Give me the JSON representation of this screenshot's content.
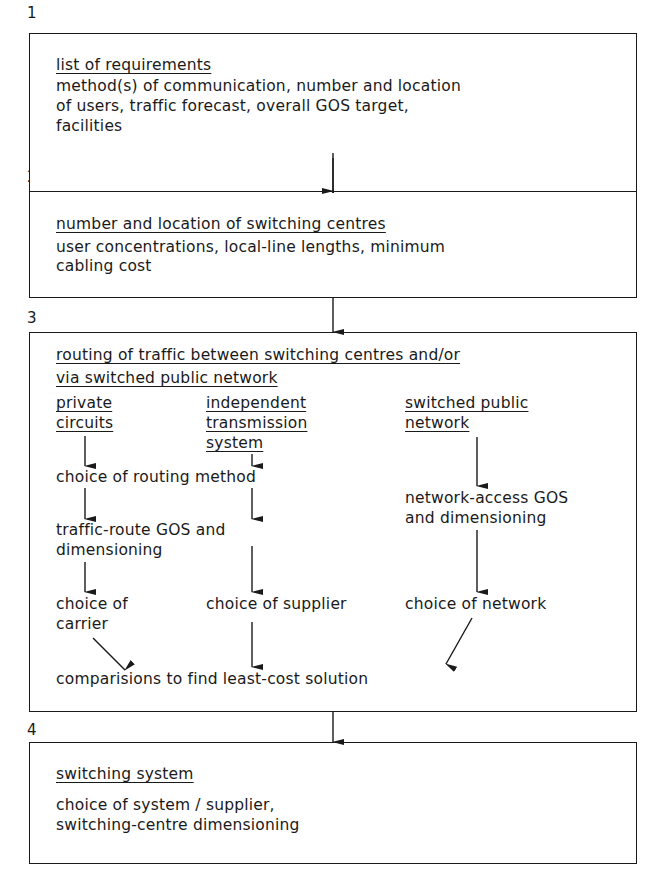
{
  "diagram": {
    "type": "flowchart",
    "steps": [
      {
        "number": "1",
        "title": "list of requirements",
        "lines": [
          "method(s) of communication, number and location",
          "of users, traffic forecast, overall GOS target,",
          "facilities"
        ]
      },
      {
        "number": "2",
        "title": "number and location of switching centres",
        "lines": [
          "user concentrations, local-line lengths, minimum",
          "cabling cost"
        ]
      },
      {
        "number": "3",
        "title_lines": [
          "routing of traffic between switching centres and/or",
          "via switched public network"
        ],
        "columns": [
          {
            "heading_lines": [
              "private",
              "circuits"
            ],
            "items": [
              "choice of routing method",
              [
                "traffic-route GOS and",
                "dimensioning"
              ],
              [
                "choice of",
                "carrier"
              ]
            ]
          },
          {
            "heading_lines": [
              "independent",
              "transmission",
              "system"
            ],
            "items": [
              "choice of supplier"
            ]
          },
          {
            "heading_lines": [
              "switched public",
              "network"
            ],
            "items": [
              [
                "network-access GOS",
                "and dimensioning"
              ],
              "choice of network"
            ]
          }
        ],
        "conclusion": "comparisions to find least-cost solution"
      },
      {
        "number": "4",
        "title": "switching system",
        "lines": [
          "choice of system / supplier,",
          "switching-centre dimensioning"
        ]
      }
    ],
    "colors": {
      "ink": "#1a1a1a",
      "background": "#ffffff"
    }
  }
}
